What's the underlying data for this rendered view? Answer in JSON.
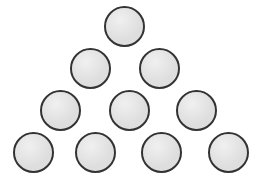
{
  "figure": {
    "background_color": "#ffffff",
    "canvas": {
      "width": 258,
      "height": 183
    }
  },
  "style": {
    "fill_color": "#dedede",
    "stroke_color": "#333333",
    "stroke_width": 2,
    "diameter": 41
  },
  "chart_data": {
    "type": "scatter",
    "xlabel": "",
    "ylabel": "",
    "xlim": [
      0,
      258
    ],
    "ylim": [
      0,
      183
    ],
    "grid": false,
    "legend": "none",
    "marker": "circle",
    "marker_fill": "#dedede",
    "marker_edge": "#333333",
    "marker_diameter": 41,
    "total_count": 10,
    "rows": [
      {
        "row": 1,
        "count": 1,
        "cy": 26,
        "cx": [
          124
        ]
      },
      {
        "row": 2,
        "count": 2,
        "cy": 68,
        "cx": [
          90,
          159
        ]
      },
      {
        "row": 3,
        "count": 3,
        "cy": 110,
        "cx": [
          60,
          129,
          196
        ]
      },
      {
        "row": 4,
        "count": 4,
        "cy": 152,
        "cx": [
          33,
          95,
          161,
          228
        ]
      }
    ],
    "points": [
      {
        "id": 1,
        "row": 1,
        "col": 1,
        "x": 124,
        "y": 26
      },
      {
        "id": 2,
        "row": 2,
        "col": 1,
        "x": 90,
        "y": 68
      },
      {
        "id": 3,
        "row": 2,
        "col": 2,
        "x": 159,
        "y": 68
      },
      {
        "id": 4,
        "row": 3,
        "col": 1,
        "x": 60,
        "y": 110
      },
      {
        "id": 5,
        "row": 3,
        "col": 2,
        "x": 129,
        "y": 110
      },
      {
        "id": 6,
        "row": 3,
        "col": 3,
        "x": 196,
        "y": 110
      },
      {
        "id": 7,
        "row": 4,
        "col": 1,
        "x": 33,
        "y": 152
      },
      {
        "id": 8,
        "row": 4,
        "col": 2,
        "x": 95,
        "y": 152
      },
      {
        "id": 9,
        "row": 4,
        "col": 3,
        "x": 161,
        "y": 152
      },
      {
        "id": 10,
        "row": 4,
        "col": 4,
        "x": 228,
        "y": 152
      }
    ]
  }
}
